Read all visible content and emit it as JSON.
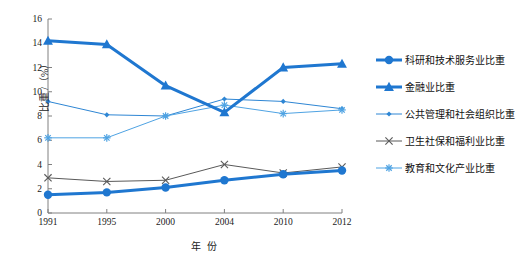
{
  "chart_data": {
    "type": "line",
    "title": "",
    "xlabel": "年 份",
    "ylabel": "比重 /（%）",
    "categories": [
      "1991",
      "1995",
      "2000",
      "2004",
      "2010",
      "2012"
    ],
    "ylim": [
      0,
      16
    ],
    "yticks": [
      0,
      2,
      4,
      6,
      8,
      10,
      12,
      14,
      16
    ],
    "grid": false,
    "legend_position": "right",
    "series": [
      {
        "name": "科研和技术服务业比重",
        "marker": "circle",
        "color": "#1F77D0",
        "line_width": 3,
        "values": [
          1.5,
          1.7,
          2.1,
          2.7,
          3.2,
          3.5
        ]
      },
      {
        "name": "金融业比重",
        "marker": "triangle",
        "color": "#1F77D0",
        "line_width": 3,
        "values": [
          14.2,
          13.9,
          10.5,
          8.3,
          12.0,
          12.3
        ]
      },
      {
        "name": "公共管理和社会组织比重",
        "marker": "small-diamond",
        "color": "#2E86D4",
        "line_width": 1,
        "values": [
          9.2,
          8.1,
          8.0,
          9.4,
          9.2,
          8.6
        ]
      },
      {
        "name": "卫生社保和福利业比重",
        "marker": "x-cross",
        "color": "#595959",
        "line_width": 1,
        "values": [
          2.9,
          2.6,
          2.7,
          4.0,
          3.3,
          3.8
        ]
      },
      {
        "name": "教育和文化产业比重",
        "marker": "asterisk",
        "color": "#4FA3E3",
        "line_width": 1,
        "values": [
          6.2,
          6.2,
          8.0,
          8.9,
          8.2,
          8.5
        ]
      }
    ]
  },
  "axis": {
    "y_tick_labels": [
      "16",
      "14",
      "12",
      "10",
      "8",
      "6",
      "4",
      "2",
      "0"
    ],
    "x_tick_labels": [
      "1991",
      "1995",
      "2000",
      "2004",
      "2010",
      "2012"
    ],
    "y_title": "比重 /（%）",
    "x_title": "年 份"
  },
  "legend": {
    "items": [
      {
        "label": "科研和技术服务业比重"
      },
      {
        "label": "金融业比重"
      },
      {
        "label": "公共管理和社会组织比重"
      },
      {
        "label": "卫生社保和福利业比重"
      },
      {
        "label": "教育和文化产业比重"
      }
    ]
  },
  "colors": {
    "primary_blue": "#1F77D0",
    "mid_blue": "#2E86D4",
    "light_blue": "#4FA3E3",
    "gray": "#595959",
    "axis": "#808080"
  }
}
